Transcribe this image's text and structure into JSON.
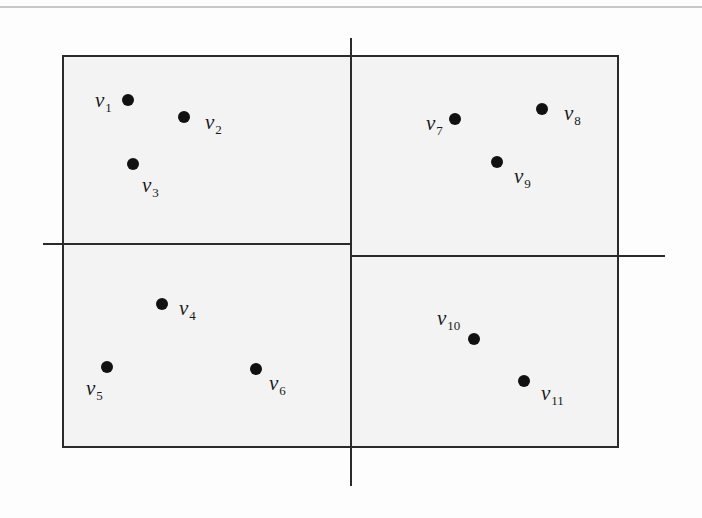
{
  "diagram": {
    "type": "spatial-partition",
    "colors": {
      "background": "#fdfdfd",
      "region_fill": "#f3f3f3",
      "line": "#2a2a2a",
      "point": "#111111",
      "top_rule": "#c8c8c8"
    },
    "bounding_box": {
      "left": 62,
      "top": 55,
      "right": 618,
      "bottom": 447
    },
    "split_lines": {
      "vertical": {
        "x": 351,
        "y1": 38,
        "y2": 486
      },
      "horizontal_left": {
        "y": 244,
        "x1": 43,
        "x2": 351
      },
      "horizontal_right": {
        "y": 256,
        "x1": 351,
        "x2": 665
      }
    },
    "points": [
      {
        "name": "v",
        "sub": "1",
        "x": 128,
        "y": 100,
        "label_x": 95,
        "label_y": 90,
        "region": "top-left"
      },
      {
        "name": "v",
        "sub": "2",
        "x": 184,
        "y": 117,
        "label_x": 205,
        "label_y": 112,
        "region": "top-left"
      },
      {
        "name": "v",
        "sub": "3",
        "x": 133,
        "y": 164,
        "label_x": 142,
        "label_y": 175,
        "region": "top-left"
      },
      {
        "name": "v",
        "sub": "4",
        "x": 162,
        "y": 304,
        "label_x": 179,
        "label_y": 298,
        "region": "bottom-left"
      },
      {
        "name": "v",
        "sub": "5",
        "x": 107,
        "y": 367,
        "label_x": 86,
        "label_y": 378,
        "region": "bottom-left"
      },
      {
        "name": "v",
        "sub": "6",
        "x": 256,
        "y": 369,
        "label_x": 269,
        "label_y": 373,
        "region": "bottom-left"
      },
      {
        "name": "v",
        "sub": "7",
        "x": 455,
        "y": 119,
        "label_x": 426,
        "label_y": 113,
        "region": "top-right"
      },
      {
        "name": "v",
        "sub": "8",
        "x": 542,
        "y": 109,
        "label_x": 564,
        "label_y": 103,
        "region": "top-right"
      },
      {
        "name": "v",
        "sub": "9",
        "x": 497,
        "y": 162,
        "label_x": 514,
        "label_y": 166,
        "region": "top-right"
      },
      {
        "name": "v",
        "sub": "10",
        "x": 474,
        "y": 339,
        "label_x": 437,
        "label_y": 308,
        "region": "bottom-right"
      },
      {
        "name": "v",
        "sub": "11",
        "x": 524,
        "y": 381,
        "label_x": 541,
        "label_y": 383,
        "region": "bottom-right"
      }
    ]
  }
}
